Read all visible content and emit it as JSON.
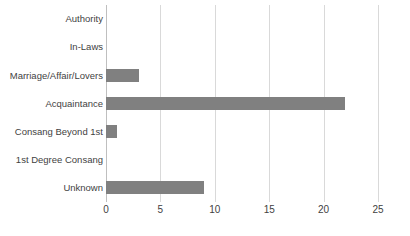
{
  "chart_data": {
    "type": "bar",
    "orientation": "horizontal",
    "title": "",
    "subtitle": "",
    "xlabel": "",
    "ylabel": "",
    "categories": [
      "Authority",
      "In-Laws",
      "Marriage/Affair/Lovers",
      "Acquaintance",
      "Consang Beyond 1st",
      "1st Degree Consang",
      "Unknown"
    ],
    "values": [
      0,
      0,
      3,
      22,
      1,
      0,
      9
    ],
    "xlim": [
      0,
      25
    ],
    "xticks": [
      0,
      5,
      10,
      15,
      20,
      25
    ],
    "xtick_labels": [
      "0",
      "5",
      "10",
      "15",
      "20",
      "25"
    ],
    "grid": "vertical",
    "legend": "none",
    "bar_color": "#808080",
    "gridline_color": "#d9d9d9",
    "axis_color": "#bfbfbf",
    "background_color": "#ffffff"
  }
}
